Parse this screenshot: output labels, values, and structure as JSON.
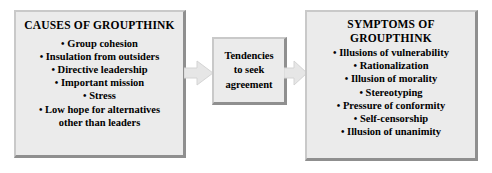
{
  "diagram": {
    "type": "flow",
    "direction": "left-to-right",
    "boxes": [
      {
        "id": "causes",
        "title": "CAUSES OF GROUPTHINK",
        "items": [
          "Group cohesion",
          "Insulation from outsiders",
          "Directive leadership",
          "Important mission",
          "Stress",
          "Low hope for alternatives\nother than leaders"
        ]
      },
      {
        "id": "tendencies",
        "lines": [
          "Tendencies",
          "to seek",
          "agreement"
        ]
      },
      {
        "id": "symptoms",
        "title": "SYMPTOMS OF\nGROUPTHINK",
        "items": [
          "Illusions of vulnerability",
          "Rationalization",
          "Illusion of morality",
          "Stereotyping",
          "Pressure of conformity",
          "Self-censorship",
          "Illusion of unanimity"
        ]
      }
    ],
    "arrows": [
      {
        "id": "causes-to-tendencies",
        "from": "causes",
        "to": "tendencies",
        "shape": "block-arrow-right"
      },
      {
        "id": "tendencies-to-symptoms",
        "from": "tendencies",
        "to": "symptoms",
        "shape": "block-arrow-right"
      }
    ],
    "bullet_glyph": "•",
    "colors": {
      "box_fill": "#ebebeb",
      "box_border_light": "#c9c9c9",
      "box_border_dark": "#8f8f8f",
      "text": "#000000",
      "arrow_fill": "#e4e4e4",
      "arrow_stroke": "#d2d2d2",
      "background": "#ffffff"
    }
  }
}
